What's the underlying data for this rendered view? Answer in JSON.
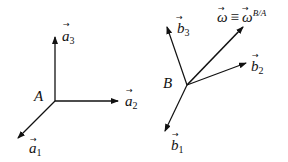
{
  "frame_a": {
    "origin_label": "A",
    "vectors": [
      {
        "name": "a",
        "sub": "1"
      },
      {
        "name": "a",
        "sub": "2"
      },
      {
        "name": "a",
        "sub": "3"
      }
    ]
  },
  "frame_b": {
    "origin_label": "B",
    "vectors": [
      {
        "name": "b",
        "sub": "1"
      },
      {
        "name": "b",
        "sub": "2"
      },
      {
        "name": "b",
        "sub": "3"
      }
    ],
    "omega": {
      "lhs": "ω",
      "equiv": "≡",
      "rhs": "ω",
      "sup": "B/A"
    }
  },
  "arrow": "→"
}
